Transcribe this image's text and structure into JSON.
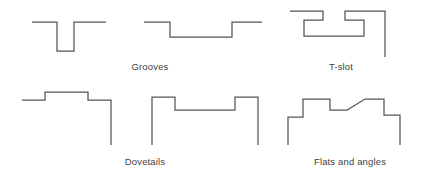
{
  "figure": {
    "background_color": "#ffffff",
    "line_color": "#555555",
    "text_color": "#3f3f3f",
    "width": 422,
    "height": 176
  },
  "captions": [
    {
      "id": "grooves",
      "label": "Grooves",
      "x": 150,
      "y": 70
    },
    {
      "id": "t-slot",
      "label": "T-slot",
      "x": 341,
      "y": 70
    },
    {
      "id": "dovetails",
      "label": "Dovetails",
      "x": 145,
      "y": 165
    },
    {
      "id": "flats-and-angles",
      "label": "Flats and angles",
      "x": 350,
      "y": 165
    }
  ],
  "profiles": [
    {
      "id": "narrow-groove",
      "name": "Narrow rectangular groove",
      "caption_ref": "grooves",
      "path": "M 32 22 L 57 22 L 57 51 L 74 51 L 74 22 L 106 22"
    },
    {
      "id": "wide-groove",
      "name": "Wide shallow groove",
      "caption_ref": "grooves",
      "path": "M 144 22 L 170 22 L 170 37 L 232 37 L 232 22 L 262 22"
    },
    {
      "id": "t-slot-profile",
      "name": "T-slot",
      "caption_ref": "t-slot",
      "path": "M 290 11 L 323 11 L 323 20 L 304 20 L 304 36 L 364 36 L 364 20 L 345 20 L 345 11 L 385 11 L 385 57"
    },
    {
      "id": "male-dovetail",
      "name": "Male dovetail (protruding)",
      "caption_ref": "dovetails",
      "path": "M 22 100 L 45 100 L 45 92 L 88 92 L 88 100 L 111 100 L 111 145"
    },
    {
      "id": "female-dovetail",
      "name": "Female dovetail (recessed)",
      "caption_ref": "dovetails",
      "path": "M 152 145 L 152 97 L 175 97 L 175 110 L 235 110 L 235 97 L 258 97 L 258 145"
    },
    {
      "id": "flats-and-angles-profile",
      "name": "Flats and angles stepped profile",
      "caption_ref": "flats-and-angles",
      "path": "M 288 145 L 288 117 L 303 117 L 303 99 L 330 99 L 330 110 L 347 110 L 365 99 L 384 99 L 384 115 L 400 115 L 400 145"
    }
  ]
}
